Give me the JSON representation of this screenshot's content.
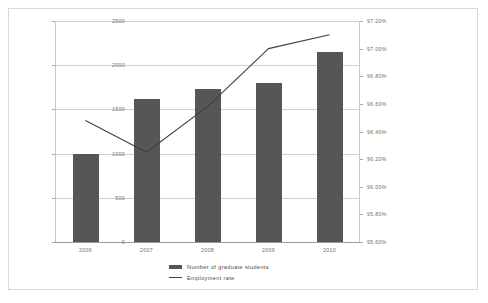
{
  "chart_data": {
    "type": "bar",
    "title": "",
    "subtitle": "",
    "xlabel": "",
    "ylabel": "",
    "categories": [
      "2006",
      "2007",
      "2008",
      "2009",
      "2010"
    ],
    "grid": true,
    "legend_position": "bottom",
    "series": [
      {
        "name": "Number of graduate students",
        "type": "bar",
        "axis": "left",
        "color": "#565656",
        "values": [
          1000,
          1620,
          1730,
          1800,
          2150
        ]
      },
      {
        "name": "Employment rate",
        "type": "line",
        "axis": "right",
        "color": "#3f3f3f",
        "values": [
          96.48,
          96.25,
          96.58,
          97.0,
          97.1
        ]
      }
    ],
    "left_axis": {
      "label": "",
      "min": 0,
      "max": 2500,
      "ticks": [
        0,
        500,
        1000,
        1500,
        2000,
        2500
      ],
      "ticklabels": [
        "0",
        "500",
        "1000",
        "1500",
        "2000",
        "2500"
      ]
    },
    "right_axis": {
      "label": "",
      "min": 95.6,
      "max": 97.2,
      "ticks": [
        95.6,
        95.8,
        96.0,
        96.2,
        96.4,
        96.6,
        96.8,
        97.0,
        97.2
      ],
      "ticklabels": [
        "95.60%",
        "95.80%",
        "96.00%",
        "96.20%",
        "96.40%",
        "96.60%",
        "96.80%",
        "97.00%",
        "97.20%"
      ]
    }
  },
  "legend": {
    "items": [
      {
        "label": "Number of graduate students",
        "marker": "bar-swatch"
      },
      {
        "label": "Employment rate",
        "marker": "line-swatch"
      }
    ]
  }
}
